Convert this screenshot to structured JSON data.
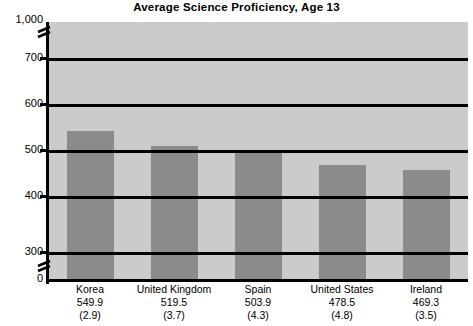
{
  "chart_data": {
    "type": "bar",
    "title": "Average Science Proficiency, Age 13",
    "xlabel": "",
    "ylabel": "",
    "categories": [
      "Korea",
      "United Kingdom",
      "Spain",
      "United States",
      "Ireland"
    ],
    "values": [
      549.9,
      519.5,
      503.9,
      478.5,
      469.3
    ],
    "value_labels": [
      "549.9",
      "519.5",
      "503.9",
      "478.5",
      "469.3"
    ],
    "standard_errors": [
      2.9,
      3.7,
      4.3,
      4.8,
      3.5
    ],
    "standard_error_labels": [
      "(2.9)",
      "(3.7)",
      "(4.3)",
      "(4.8)",
      "(3.5)"
    ],
    "series": [
      {
        "name": "Average Science Proficiency",
        "values": [
          549.9,
          519.5,
          503.9,
          478.5,
          469.3
        ]
      }
    ],
    "ylim": [
      0,
      1000
    ],
    "ytick_labels": [
      "1,000",
      "700",
      "600",
      "500",
      "400",
      "300",
      "0"
    ],
    "ytick_values": [
      1000,
      700,
      600,
      500,
      400,
      300,
      0
    ],
    "axis_break": true,
    "axis_break_notes": [
      "break between 0 and 300",
      "break between 700 and 1,000"
    ],
    "grid": true,
    "grid_axis": "y",
    "legend": false,
    "legend_position": "none",
    "colors": {
      "bar": "#8b8b8b",
      "plot_background": "#cbcbcb",
      "gridline": "#000000",
      "axis": "#000000",
      "text": "#000000",
      "page_background": "#ffffff"
    }
  }
}
